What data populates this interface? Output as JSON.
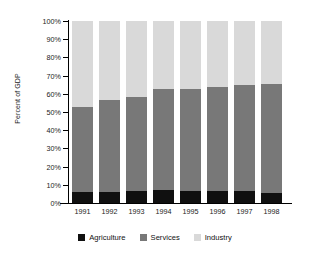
{
  "chart_data": {
    "type": "bar",
    "subtype": "100% stacked column",
    "title": "",
    "xlabel": "",
    "ylabel": "Percent of GDP",
    "ylim": [
      0,
      100
    ],
    "yticks": [
      "0%",
      "10%",
      "20%",
      "30%",
      "40%",
      "50%",
      "60%",
      "70%",
      "80%",
      "90%",
      "100%"
    ],
    "ytick_values": [
      0,
      10,
      20,
      30,
      40,
      50,
      60,
      70,
      80,
      90,
      100
    ],
    "grid": false,
    "legend_position": "bottom",
    "categories": [
      "1991",
      "1992",
      "1993",
      "1994",
      "1995",
      "1996",
      "1997",
      "1998"
    ],
    "series": [
      {
        "name": "Agriculture",
        "color": "#101010",
        "values": [
          6,
          6,
          6.5,
          7,
          6.5,
          6.5,
          6.5,
          5.5
        ]
      },
      {
        "name": "Services",
        "color": "#787878",
        "values": [
          47,
          50.5,
          52,
          55.5,
          56,
          57.5,
          58.5,
          60
        ]
      },
      {
        "name": "Industry",
        "color": "#d9d9d9",
        "values": [
          47,
          43.5,
          41.5,
          37.5,
          37.5,
          36,
          35,
          34.5
        ]
      }
    ],
    "cumulative_tops": {
      "agriculture": [
        6,
        6,
        6.5,
        7,
        6.5,
        6.5,
        6.5,
        5.5
      ],
      "services": [
        53,
        56.5,
        58.5,
        62.5,
        62.5,
        64,
        65,
        65.5
      ],
      "industry": [
        100,
        100,
        100,
        100,
        100,
        100,
        100,
        100
      ]
    }
  }
}
